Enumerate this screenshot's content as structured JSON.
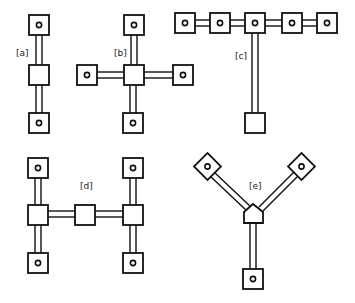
{
  "figure": {
    "colors": {
      "stroke": "#111111",
      "fill": "#ffffff"
    },
    "panels": [
      {
        "id": "a",
        "label": "[a]",
        "shape": "linear vertical: terminal - center - terminal"
      },
      {
        "id": "b",
        "label": "[b]",
        "shape": "cross: center with four terminals"
      },
      {
        "id": "c",
        "label": "[c]",
        "shape": "T: five terminals in a row, one vertical link to a plain square"
      },
      {
        "id": "d",
        "label": "[d]",
        "shape": "H: two vertical chains joined by a horizontal link through a middle square"
      },
      {
        "id": "e",
        "label": "[e]",
        "shape": "Y: pentagon hub with two diagonal terminals and one downward terminal"
      }
    ]
  }
}
